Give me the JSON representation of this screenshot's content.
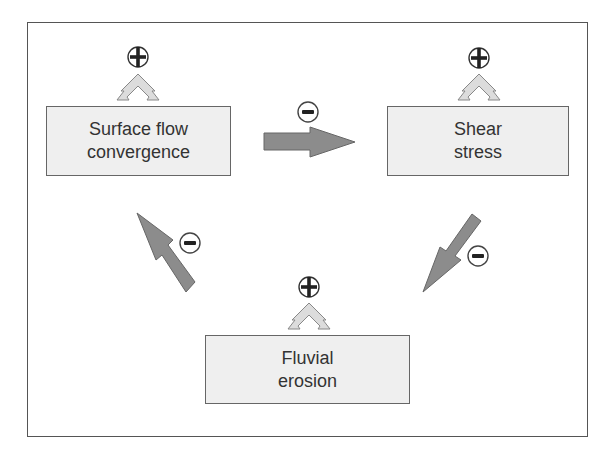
{
  "diagram": {
    "type": "feedback-loop",
    "nodes": [
      {
        "id": "surface-flow",
        "lines": [
          "Surface flow",
          "convergence"
        ],
        "self_effect": "+"
      },
      {
        "id": "shear-stress",
        "lines": [
          "Shear",
          "stress"
        ],
        "self_effect": "+"
      },
      {
        "id": "fluvial-erosion",
        "lines": [
          "Fluvial",
          "erosion"
        ],
        "self_effect": "+"
      }
    ],
    "edges": [
      {
        "from": "surface-flow",
        "to": "shear-stress",
        "sign": "-"
      },
      {
        "from": "shear-stress",
        "to": "fluvial-erosion",
        "sign": "-"
      },
      {
        "from": "fluvial-erosion",
        "to": "surface-flow",
        "sign": "-"
      }
    ],
    "colors": {
      "box_fill": "#efefef",
      "box_border": "#666666",
      "arrow_fill": "#8c8c8c",
      "chevron_fill": "#dcdcdc",
      "text": "#333333"
    }
  }
}
